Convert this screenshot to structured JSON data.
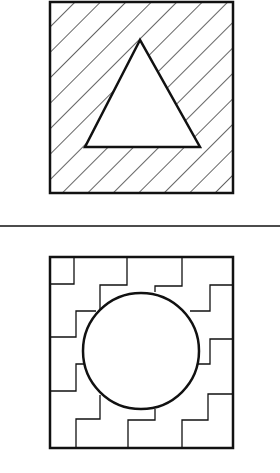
{
  "figure": {
    "top_panel": {
      "outer_shape": "square",
      "fill_pattern": "diagonal-hatching",
      "inner_shape": "triangle",
      "inner_fill": "white"
    },
    "divider": "horizontal-line",
    "bottom_panel": {
      "outer_shape": "square",
      "fill_pattern": "stepped-staircase-lines",
      "inner_shape": "circle",
      "inner_fill": "white"
    },
    "colors": {
      "stroke": "#111111",
      "background": "#ffffff"
    }
  }
}
